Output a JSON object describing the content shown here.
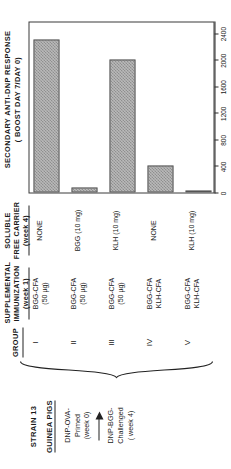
{
  "figure": {
    "strain": {
      "line1": "STRAIN 13",
      "line2": "GUINEA PIGS"
    },
    "flow": {
      "stage1_l1": "DNP-OVA-",
      "stage1_l2": "Primed",
      "stage1_l3": "(week 0)",
      "arrow": "arrow-right-icon",
      "stage2_l1": "DNP-BGG-",
      "stage2_l2": "Challenged",
      "stage2_l3": "( week 4)"
    },
    "columns": {
      "group_header": "GROUP",
      "supplemental_header_l1": "SUPPLEMENTAL",
      "supplemental_header_l2": "IMMUNIZATION",
      "supplemental_header_l3": "(week 1)",
      "carrier_header_l1": "SOLUBLE",
      "carrier_header_l2": "FREE CARRIER",
      "carrier_header_l3": "(week 4)"
    },
    "rows": [
      {
        "group": "I",
        "supplemental_l1": "BGG-CFA",
        "supplemental_l2": "(50 µg)",
        "carrier": "NONE"
      },
      {
        "group": "II",
        "supplemental_l1": "BGG-CFA",
        "supplemental_l2": "(50 µg)",
        "carrier": "BGG  (10 mg)"
      },
      {
        "group": "III",
        "supplemental_l1": "BGG-CFA",
        "supplemental_l2": "(50 µg)",
        "carrier": "KLH (10 mg)"
      },
      {
        "group": "IV",
        "supplemental_l1": "BGG-CFA",
        "supplemental_l2": "KLH-CFA",
        "carrier": "NONE"
      },
      {
        "group": "V",
        "supplemental_l1": "BGG-CFA",
        "supplemental_l2": "KLH-CFA",
        "carrier": "KLH (10 mg)"
      }
    ],
    "plot": {
      "title_l1": "SECONDARY ANTI-DNP RESPONSE",
      "title_l2": "( BOOST  DAY 7/DAY 0)",
      "axis_title": "ANTI-DNP  ANTIBODY  (µg /ml)"
    },
    "colors": {
      "bar_fill": "#b9b9b9",
      "bar_hatch": "#8f8f8f",
      "bar_border": "#555555",
      "axis": "#2a2a2a",
      "text": "#1a1a1a"
    }
  },
  "chart_data": {
    "type": "bar",
    "title": "SECONDARY ANTI-DNP RESPONSE ( BOOST DAY 7/DAY 0)",
    "xlabel": "ANTI-DNP  ANTIBODY  (µg /ml)",
    "ylabel": "",
    "orientation": "horizontal",
    "categories": [
      "I",
      "II",
      "III",
      "IV",
      "V"
    ],
    "values": [
      2300,
      80,
      2000,
      400,
      30
    ],
    "xlim": [
      0,
      2560
    ],
    "ticks": [
      0,
      400,
      800,
      1200,
      1600,
      2000,
      2400
    ],
    "tick_labels": [
      "0",
      "400",
      "800",
      "1200",
      "1600",
      "2000",
      "2400"
    ],
    "grid": false,
    "legend": false
  }
}
